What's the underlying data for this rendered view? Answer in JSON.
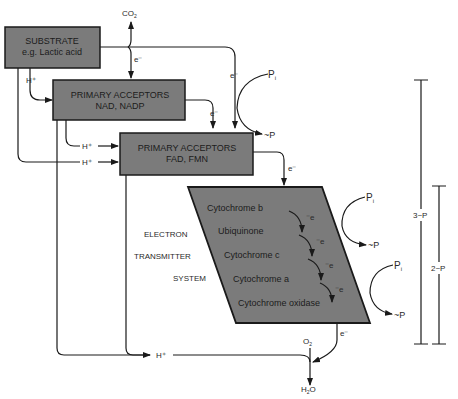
{
  "diagram": {
    "box_fill": "#7b7b7b",
    "line_color": "#1a1a1a",
    "substrate": {
      "line1": "SUBSTRATE",
      "line2": "e.g. Lactic acid"
    },
    "primary_nad": {
      "line1": "PRIMARY ACCEPTORS",
      "line2": "NAD, NADP"
    },
    "primary_fad": {
      "line1": "PRIMARY ACCEPTORS",
      "line2": "FAD, FMN"
    },
    "co2": "CO",
    "co2_sub": "2",
    "electron_label": "e⁻",
    "proton_label": "H⁺",
    "system_label": {
      "line1": "ELECTRON",
      "line2": "TRANSMITTER",
      "line3": "SYSTEM"
    },
    "cytochromes": [
      "Cytochrome b",
      "Ubiquinone",
      "Cytochrome c",
      "Cytochrome a",
      "Cytochrome oxidase"
    ],
    "chain_e_label": "⁻e",
    "pi_label": "P",
    "pi_sub": "i",
    "atp_label": "~P",
    "o2": "O",
    "o2_sub": "2",
    "h2o_pre": "H",
    "h2o_sub": "2",
    "h2o_post": "O",
    "bracket_3p": "3~P",
    "bracket_2p": "2~P"
  }
}
